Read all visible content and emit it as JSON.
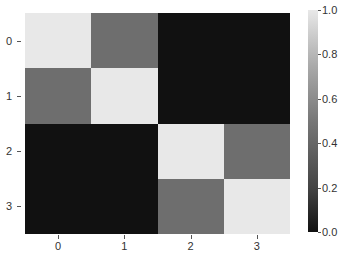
{
  "chart_data": {
    "type": "heatmap",
    "title": "",
    "xlabel": "",
    "ylabel": "",
    "x_tick_labels": [
      "0",
      "1",
      "2",
      "3"
    ],
    "y_tick_labels": [
      "0",
      "1",
      "2",
      "3"
    ],
    "values": [
      [
        1.0,
        0.5,
        0.0,
        0.0
      ],
      [
        0.5,
        1.0,
        0.0,
        0.0
      ],
      [
        0.0,
        0.0,
        1.0,
        0.5
      ],
      [
        0.0,
        0.0,
        0.5,
        1.0
      ]
    ],
    "colormap": "gray",
    "colorbar": {
      "min": 0.0,
      "max": 1.0,
      "ticks": [
        "0.0",
        "0.2",
        "0.4",
        "0.6",
        "0.8",
        "1.0"
      ]
    },
    "colors": {
      "low": "#111111",
      "mid": "#6e6e6e",
      "high": "#e8e8e8"
    }
  }
}
